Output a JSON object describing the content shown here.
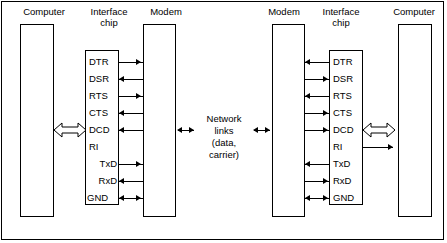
{
  "diagram": {
    "frame_border_color": "#000000",
    "background_color": "#ffffff",
    "left_side": {
      "computer_label": "Computer",
      "interface_label": "Interface\nchip",
      "modem_label": "Modem",
      "signals": [
        {
          "name": "DTR",
          "direction": "right"
        },
        {
          "name": "DSR",
          "direction": "left"
        },
        {
          "name": "RTS",
          "direction": "right"
        },
        {
          "name": "CTS",
          "direction": "left"
        },
        {
          "name": "DCD",
          "direction": "left"
        },
        {
          "name": "RI",
          "direction": "none"
        },
        {
          "name": "TxD",
          "direction": "right"
        },
        {
          "name": "RxD",
          "direction": "left"
        },
        {
          "name": "GND",
          "direction": "both"
        }
      ],
      "computer_link": "bidirectional-hollow"
    },
    "center": {
      "label": "Network\nlinks\n(data, carrier)",
      "left_arrow": "bidirectional",
      "right_arrow": "bidirectional"
    },
    "right_side": {
      "computer_label": "Computer",
      "interface_label": "Interface\nchip",
      "modem_label": "Modem",
      "signals": [
        {
          "name": "DTR",
          "direction": "left"
        },
        {
          "name": "DSR",
          "direction": "right"
        },
        {
          "name": "RTS",
          "direction": "left"
        },
        {
          "name": "CTS",
          "direction": "right"
        },
        {
          "name": "DCD",
          "direction": "right"
        },
        {
          "name": "RI",
          "direction": "line-right"
        },
        {
          "name": "TxD",
          "direction": "left"
        },
        {
          "name": "RxD",
          "direction": "right"
        },
        {
          "name": "GND",
          "direction": "both"
        }
      ],
      "computer_link": "bidirectional-hollow"
    }
  }
}
